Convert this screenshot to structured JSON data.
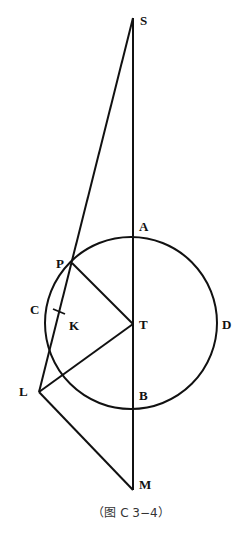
{
  "figure": {
    "caption": "（图 C 3−4）",
    "line_color": "#111111",
    "circle": {
      "cx": 131,
      "cy": 323,
      "r": 86
    },
    "points": {
      "S": {
        "label": "S",
        "x": 133,
        "y": 18,
        "lx": 140,
        "ly": 25
      },
      "A": {
        "label": "A",
        "x": 133,
        "y": 237,
        "lx": 139,
        "ly": 231
      },
      "P": {
        "label": "P",
        "x": 72,
        "y": 263,
        "lx": 56,
        "ly": 268
      },
      "C": {
        "label": "C",
        "x": 47,
        "y": 310,
        "lx": 30,
        "ly": 314
      },
      "K": {
        "label": "K",
        "x": 59,
        "y": 312,
        "lx": 69,
        "ly": 330
      },
      "T": {
        "label": "T",
        "x": 133,
        "y": 324,
        "lx": 139,
        "ly": 329
      },
      "D": {
        "label": "D",
        "x": 217,
        "y": 323,
        "lx": 222,
        "ly": 329
      },
      "L": {
        "label": "L",
        "x": 39,
        "y": 392,
        "lx": 19,
        "ly": 396
      },
      "B": {
        "label": "B",
        "x": 133,
        "y": 409,
        "lx": 139,
        "ly": 400
      },
      "M": {
        "label": "M",
        "x": 133,
        "y": 490,
        "lx": 139,
        "ly": 489
      }
    }
  }
}
